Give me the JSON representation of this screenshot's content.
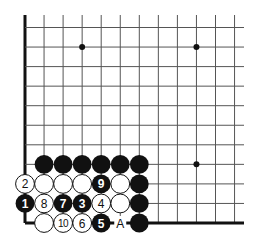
{
  "board": {
    "columns": 12,
    "rows": 11,
    "edges": [
      "left",
      "bottom"
    ],
    "star_points": [
      [
        3,
        1
      ],
      [
        9,
        1
      ],
      [
        9,
        7
      ]
    ]
  },
  "stones": [
    {
      "col": 1,
      "row": 7,
      "color": "black",
      "label": ""
    },
    {
      "col": 2,
      "row": 7,
      "color": "black",
      "label": ""
    },
    {
      "col": 3,
      "row": 7,
      "color": "black",
      "label": ""
    },
    {
      "col": 4,
      "row": 7,
      "color": "black",
      "label": ""
    },
    {
      "col": 5,
      "row": 7,
      "color": "black",
      "label": ""
    },
    {
      "col": 6,
      "row": 7,
      "color": "black",
      "label": ""
    },
    {
      "col": 0,
      "row": 8,
      "color": "white",
      "label": "2"
    },
    {
      "col": 1,
      "row": 8,
      "color": "white",
      "label": ""
    },
    {
      "col": 2,
      "row": 8,
      "color": "white",
      "label": ""
    },
    {
      "col": 3,
      "row": 8,
      "color": "white",
      "label": ""
    },
    {
      "col": 4,
      "row": 8,
      "color": "black",
      "label": "9"
    },
    {
      "col": 5,
      "row": 8,
      "color": "white",
      "label": ""
    },
    {
      "col": 6,
      "row": 8,
      "color": "black",
      "label": ""
    },
    {
      "col": 0,
      "row": 9,
      "color": "black",
      "label": "1"
    },
    {
      "col": 1,
      "row": 9,
      "color": "white",
      "label": "8"
    },
    {
      "col": 2,
      "row": 9,
      "color": "black",
      "label": "7"
    },
    {
      "col": 3,
      "row": 9,
      "color": "black",
      "label": "3"
    },
    {
      "col": 4,
      "row": 9,
      "color": "white",
      "label": "4"
    },
    {
      "col": 5,
      "row": 9,
      "color": "white",
      "label": ""
    },
    {
      "col": 6,
      "row": 9,
      "color": "black",
      "label": ""
    },
    {
      "col": 1,
      "row": 10,
      "color": "white",
      "label": ""
    },
    {
      "col": 2,
      "row": 10,
      "color": "white",
      "label": "10"
    },
    {
      "col": 3,
      "row": 10,
      "color": "white",
      "label": "6"
    },
    {
      "col": 4,
      "row": 10,
      "color": "black",
      "label": "5"
    },
    {
      "col": 6,
      "row": 10,
      "color": "black",
      "label": ""
    }
  ],
  "point_labels": [
    {
      "col": 5,
      "row": 10,
      "label": "A"
    }
  ]
}
